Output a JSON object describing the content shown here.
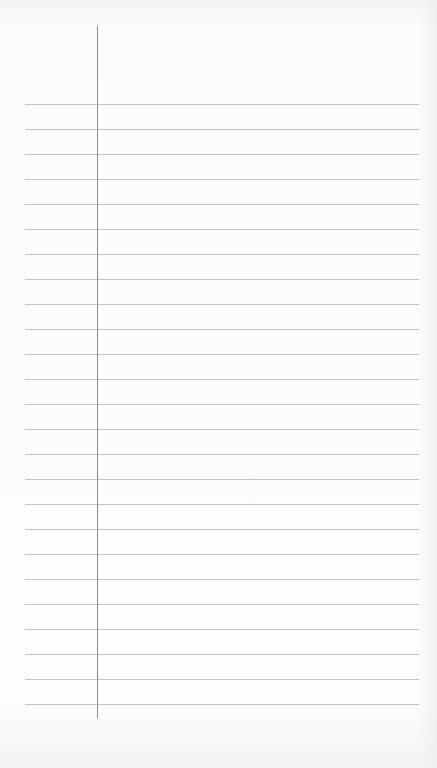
{
  "page": {
    "type": "ruled notepad page",
    "background_color": "#fbfbfb",
    "rule_color": "#c4c4c4",
    "margin_line_color": "#8e8e8e",
    "rule_count": 25,
    "rule_first_y": 104,
    "rule_spacing": 25,
    "rule_left_x": 25,
    "rule_right_x": 419,
    "margin_line_x": 97,
    "margin_line_top": 26,
    "margin_line_bottom": 718,
    "text": ""
  }
}
